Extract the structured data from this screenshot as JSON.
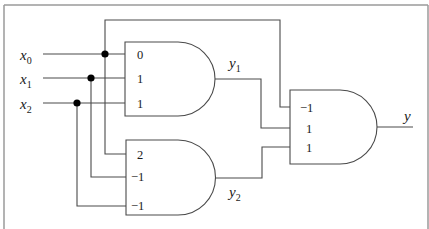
{
  "diagram": {
    "type": "threshold-logic-circuit",
    "inputs": [
      {
        "name": "x",
        "subscript": "0"
      },
      {
        "name": "x",
        "subscript": "1"
      },
      {
        "name": "x",
        "subscript": "2"
      }
    ],
    "gates": [
      {
        "id": "gate-1",
        "output": {
          "name": "y",
          "subscript": "1"
        },
        "weights": [
          "0",
          "1",
          "1"
        ],
        "inputs_from": [
          "x0",
          "x1",
          "x2"
        ]
      },
      {
        "id": "gate-2",
        "output": {
          "name": "y",
          "subscript": "2"
        },
        "weights": [
          "2",
          "−1",
          "−1"
        ],
        "inputs_from": [
          "x0",
          "x1",
          "x2"
        ]
      },
      {
        "id": "gate-3",
        "output": {
          "name": "y",
          "subscript": ""
        },
        "weights": [
          "−1",
          "1",
          "1"
        ],
        "inputs_from": [
          "x0",
          "y1",
          "y2"
        ]
      }
    ],
    "colors": {
      "wire": "#4a4a4a",
      "junction": "#000000",
      "frame": "#9a9a9a",
      "background": "#ffffff"
    }
  }
}
